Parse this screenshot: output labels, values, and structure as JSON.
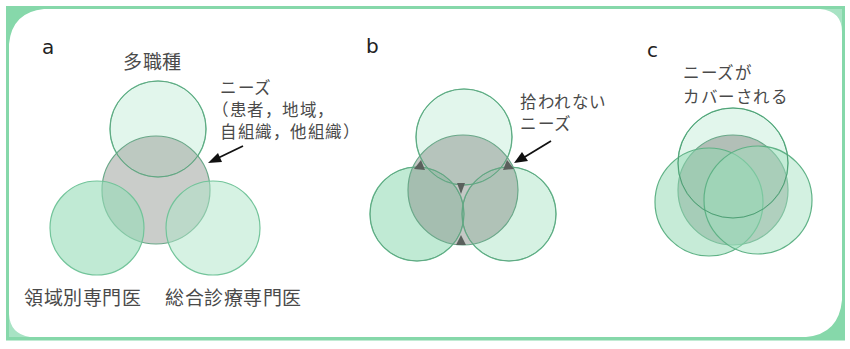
{
  "colors": {
    "frame": "#86d8aa",
    "circle_light_fill": "#e2f6ec",
    "circle_mid_fill": "#a9e4c5",
    "circle_stroke": "#6dbf93",
    "gray_fill": "#a3a8a3",
    "gap_triangle": "#5a605c",
    "text": "#4a4a4a",
    "arrow": "#111111"
  },
  "panels": {
    "a": {
      "letter": "a",
      "top_label": "多職種",
      "needs_label": {
        "line1": "ニーズ",
        "line2": "（患者，地域，",
        "line3": "自組織，他組織）"
      },
      "bottom_left_label": "領域別専門医",
      "bottom_right_label": "総合診療専門医",
      "circles": [
        {
          "role": "multi-profession",
          "cx": 158,
          "cy": 129,
          "r": 48
        },
        {
          "role": "needs",
          "cx": 156,
          "cy": 190,
          "r": 54
        },
        {
          "role": "specialist",
          "cx": 97,
          "cy": 228,
          "r": 47
        },
        {
          "role": "general-practice",
          "cx": 213,
          "cy": 228,
          "r": 47
        }
      ]
    },
    "b": {
      "letter": "b",
      "gap_label": {
        "line1": "拾われない",
        "line2": "ニーズ"
      },
      "circles": [
        {
          "role": "multi-profession",
          "cx": 464,
          "cy": 137,
          "r": 48
        },
        {
          "role": "needs",
          "cx": 463,
          "cy": 190,
          "r": 55
        },
        {
          "role": "specialist",
          "cx": 417,
          "cy": 214,
          "r": 47
        },
        {
          "role": "general-practice",
          "cx": 509,
          "cy": 214,
          "r": 47
        }
      ]
    },
    "c": {
      "letter": "c",
      "covered_label": {
        "line1": "ニーズが",
        "line2": "カバーされる"
      },
      "circles": [
        {
          "role": "multi-profession",
          "cx": 733,
          "cy": 163,
          "r": 55
        },
        {
          "role": "needs",
          "cx": 733,
          "cy": 190,
          "r": 55
        },
        {
          "role": "specialist",
          "cx": 709,
          "cy": 202,
          "r": 54
        },
        {
          "role": "general-practice",
          "cx": 758,
          "cy": 200,
          "r": 54
        }
      ]
    }
  }
}
